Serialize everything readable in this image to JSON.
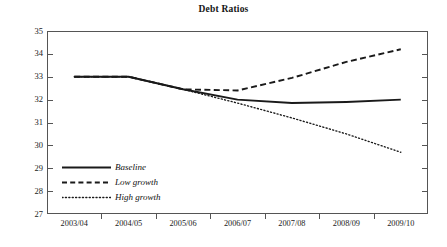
{
  "chart_data": {
    "type": "line",
    "title": "Debt Ratios",
    "xlabel": "",
    "ylabel": "",
    "categories": [
      "2003/04",
      "2004/05",
      "2005/06",
      "2006/07",
      "2007/08",
      "2008/09",
      "2009/10"
    ],
    "ylim": [
      27,
      35
    ],
    "yticks": [
      27,
      28,
      29,
      30,
      31,
      32,
      33,
      34,
      35
    ],
    "grid": false,
    "legend_position": "inside-bottom-left",
    "series": [
      {
        "name": "Baseline",
        "style": "solid",
        "color": "#1a1a1a",
        "values": [
          33.0,
          33.0,
          32.45,
          32.0,
          31.85,
          31.9,
          32.0
        ]
      },
      {
        "name": "Low growth",
        "style": "dashed",
        "color": "#1a1a1a",
        "values": [
          33.0,
          33.0,
          32.45,
          32.4,
          32.95,
          33.65,
          34.2
        ]
      },
      {
        "name": "High growth",
        "style": "dotted",
        "color": "#1a1a1a",
        "values": [
          33.0,
          33.0,
          32.45,
          31.85,
          31.2,
          30.5,
          29.7
        ]
      }
    ]
  },
  "legend": {
    "items": [
      {
        "label": "Baseline",
        "sample": "solid-line-sample"
      },
      {
        "label": "Low growth",
        "sample": "dashed-line-sample"
      },
      {
        "label": "High growth",
        "sample": "dotted-line-sample"
      }
    ]
  },
  "axes": {
    "y_labels": [
      "35",
      "34",
      "33",
      "32",
      "31",
      "30",
      "29",
      "28",
      "27"
    ],
    "x_labels": [
      "2003/04",
      "2004/05",
      "2005/06",
      "2006/07",
      "2007/08",
      "2008/09",
      "2009/10"
    ]
  },
  "colors": {
    "ink": "#1a1a1a",
    "axis": "#555555",
    "background": "#ffffff"
  }
}
